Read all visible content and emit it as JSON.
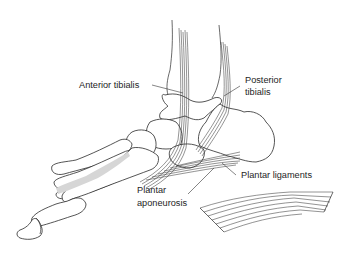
{
  "figure": {
    "labels": {
      "anterior_tibialis": "Anterior tibialis",
      "posterior_tibialis_line1": "Posterior",
      "posterior_tibialis_line2": "tibialis",
      "plantar_ligaments": "Plantar ligaments",
      "plantar_aponeurosis_line1": "Plantar",
      "plantar_aponeurosis_line2": "aponeurosis"
    },
    "colors": {
      "line": "#2a2a2a",
      "background": "#ffffff",
      "shading": "#d6d6d6"
    }
  }
}
